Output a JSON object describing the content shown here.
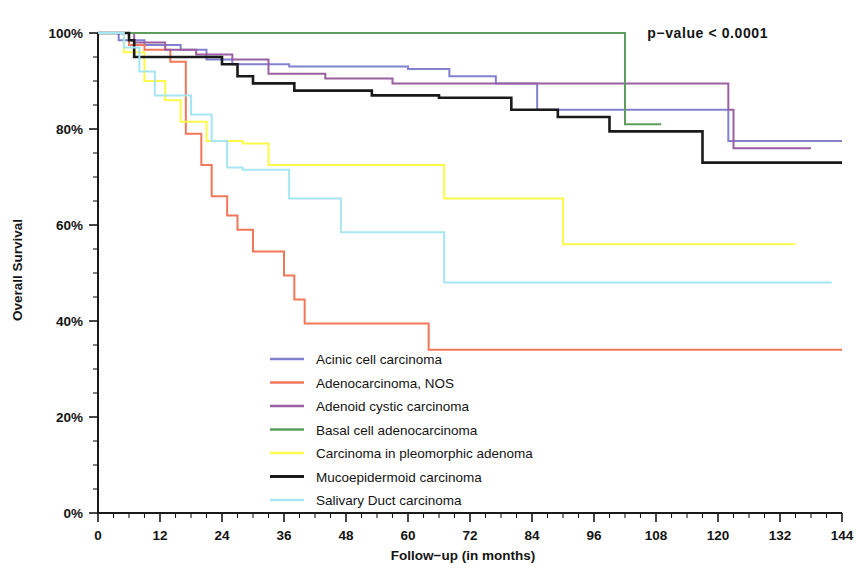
{
  "chart_data": {
    "type": "line",
    "title": "",
    "subtitle": "",
    "xlabel": "Follow−up (in months)",
    "ylabel": "Overall Survival",
    "xlim": [
      0,
      144
    ],
    "ylim": [
      0,
      100
    ],
    "xticks": [
      0,
      12,
      24,
      36,
      48,
      60,
      72,
      84,
      96,
      108,
      120,
      132,
      144
    ],
    "xtick_labels": [
      "0",
      "12",
      "24",
      "36",
      "48",
      "60",
      "72",
      "84",
      "96",
      "108",
      "120",
      "132",
      "144"
    ],
    "yticks": [
      0,
      20,
      40,
      60,
      80,
      100
    ],
    "ytick_labels": [
      "0%",
      "20%",
      "40%",
      "60%",
      "80%",
      "100%"
    ],
    "x_minor_tick_interval": 3,
    "y_minor_tick_interval": 5,
    "grid": false,
    "legend_position": "center-bottom-inside",
    "annotations": [
      {
        "name": "p-value",
        "text": "p−value  <  0.0001",
        "x": 118,
        "y": 99
      }
    ],
    "step_type": "post",
    "series": [
      {
        "name": "Acinic cell carcinoma",
        "color": "#8281cf",
        "thick": false,
        "points": [
          [
            0,
            100
          ],
          [
            4,
            100
          ],
          [
            4,
            98.5
          ],
          [
            9,
            98.5
          ],
          [
            9,
            97.5
          ],
          [
            16,
            97.5
          ],
          [
            16,
            96.5
          ],
          [
            21,
            96.5
          ],
          [
            21,
            94.5
          ],
          [
            26,
            94.5
          ],
          [
            26,
            93.5
          ],
          [
            37,
            93.5
          ],
          [
            37,
            93.0
          ],
          [
            60,
            93.0
          ],
          [
            60,
            92.5
          ],
          [
            68,
            92.5
          ],
          [
            68,
            91.0
          ],
          [
            77,
            91.0
          ],
          [
            77,
            89.5
          ],
          [
            85,
            89.5
          ],
          [
            85,
            84.0
          ],
          [
            122,
            84.0
          ],
          [
            122,
            77.5
          ],
          [
            144,
            77.5
          ]
        ]
      },
      {
        "name": "Adenocarcinoma, NOS",
        "color": "#f0775a",
        "thick": false,
        "points": [
          [
            0,
            100
          ],
          [
            6,
            100
          ],
          [
            6,
            97.5
          ],
          [
            9,
            97.5
          ],
          [
            9,
            96.5
          ],
          [
            14,
            96.5
          ],
          [
            14,
            94.0
          ],
          [
            17,
            94.0
          ],
          [
            17,
            92.5
          ],
          [
            17,
            79.0
          ],
          [
            20,
            79.0
          ],
          [
            20,
            72.5
          ],
          [
            22,
            72.5
          ],
          [
            22,
            66.0
          ],
          [
            25,
            66.0
          ],
          [
            25,
            62.0
          ],
          [
            27,
            62.0
          ],
          [
            27,
            59.0
          ],
          [
            30,
            59.0
          ],
          [
            30,
            54.5
          ],
          [
            36,
            54.5
          ],
          [
            36,
            49.5
          ],
          [
            38,
            49.5
          ],
          [
            38,
            44.5
          ],
          [
            40,
            44.5
          ],
          [
            40,
            39.5
          ],
          [
            64,
            39.5
          ],
          [
            64,
            34.0
          ],
          [
            144,
            34.0
          ]
        ]
      },
      {
        "name": "Adenoid cystic carcinoma",
        "color": "#9a5fa0",
        "thick": false,
        "points": [
          [
            0,
            100
          ],
          [
            7,
            100
          ],
          [
            7,
            98.0
          ],
          [
            13,
            98.0
          ],
          [
            13,
            96.5
          ],
          [
            19,
            96.5
          ],
          [
            19,
            95.5
          ],
          [
            26,
            95.5
          ],
          [
            26,
            94.5
          ],
          [
            33,
            94.5
          ],
          [
            33,
            91.5
          ],
          [
            44,
            91.5
          ],
          [
            44,
            90.5
          ],
          [
            57,
            90.5
          ],
          [
            57,
            89.5
          ],
          [
            122,
            89.5
          ],
          [
            122,
            84.0
          ],
          [
            123,
            84.0
          ],
          [
            123,
            76.0
          ],
          [
            138,
            76.0
          ]
        ]
      },
      {
        "name": "Basal cell adenocarcinoma",
        "color": "#5d9e5d",
        "thick": false,
        "points": [
          [
            0,
            100
          ],
          [
            102,
            100
          ],
          [
            102,
            81.0
          ],
          [
            109,
            81.0
          ]
        ]
      },
      {
        "name": "Carcinoma in pleomorphic adenoma",
        "color": "#fbf949",
        "thick": false,
        "points": [
          [
            0,
            100
          ],
          [
            5,
            100
          ],
          [
            5,
            96.0
          ],
          [
            9,
            96.0
          ],
          [
            9,
            90.0
          ],
          [
            13,
            90.0
          ],
          [
            13,
            86.0
          ],
          [
            16,
            86.0
          ],
          [
            16,
            81.5
          ],
          [
            21,
            81.5
          ],
          [
            21,
            77.5
          ],
          [
            28,
            77.5
          ],
          [
            28,
            77.0
          ],
          [
            33,
            77.0
          ],
          [
            33,
            72.5
          ],
          [
            67,
            72.5
          ],
          [
            67,
            65.5
          ],
          [
            90,
            65.5
          ],
          [
            90,
            56.0
          ],
          [
            135,
            56.0
          ]
        ]
      },
      {
        "name": "Mucoepidermoid carcinoma",
        "color": "#1a1a1a",
        "thick": true,
        "points": [
          [
            0,
            100
          ],
          [
            6,
            100
          ],
          [
            6,
            98.5
          ],
          [
            7,
            98.5
          ],
          [
            7,
            95.0
          ],
          [
            24,
            95.0
          ],
          [
            24,
            93.5
          ],
          [
            27,
            93.5
          ],
          [
            27,
            91.0
          ],
          [
            30,
            91.0
          ],
          [
            30,
            89.5
          ],
          [
            38,
            89.5
          ],
          [
            38,
            88.0
          ],
          [
            53,
            88.0
          ],
          [
            53,
            87.0
          ],
          [
            66,
            87.0
          ],
          [
            66,
            86.5
          ],
          [
            80,
            86.5
          ],
          [
            80,
            84.0
          ],
          [
            89,
            84.0
          ],
          [
            89,
            82.5
          ],
          [
            99,
            82.5
          ],
          [
            99,
            79.5
          ],
          [
            117,
            79.5
          ],
          [
            117,
            73.0
          ],
          [
            144,
            73.0
          ]
        ]
      },
      {
        "name": "Salivary Duct carcinoma",
        "color": "#a6e6f2",
        "thick": false,
        "points": [
          [
            0,
            100
          ],
          [
            5,
            100
          ],
          [
            5,
            97.0
          ],
          [
            8,
            97.0
          ],
          [
            8,
            92.0
          ],
          [
            11,
            92.0
          ],
          [
            11,
            87.0
          ],
          [
            18,
            87.0
          ],
          [
            18,
            83.0
          ],
          [
            22,
            83.0
          ],
          [
            22,
            77.5
          ],
          [
            25,
            77.5
          ],
          [
            25,
            72.0
          ],
          [
            28,
            72.0
          ],
          [
            28,
            71.5
          ],
          [
            37,
            71.5
          ],
          [
            37,
            65.5
          ],
          [
            47,
            65.5
          ],
          [
            47,
            58.5
          ],
          [
            67,
            58.5
          ],
          [
            67,
            48.0
          ],
          [
            142,
            48.0
          ]
        ]
      }
    ]
  },
  "legend": {
    "items": [
      {
        "label": "Acinic cell carcinoma",
        "color": "#8281cf"
      },
      {
        "label": "Adenocarcinoma, NOS",
        "color": "#f0775a"
      },
      {
        "label": "Adenoid cystic carcinoma",
        "color": "#9a5fa0"
      },
      {
        "label": "Basal cell adenocarcinoma",
        "color": "#5d9e5d"
      },
      {
        "label": "Carcinoma in pleomorphic adenoma",
        "color": "#fbf949"
      },
      {
        "label": "Mucoepidermoid carcinoma",
        "color": "#1a1a1a"
      },
      {
        "label": "Salivary Duct carcinoma",
        "color": "#a6e6f2"
      }
    ]
  }
}
